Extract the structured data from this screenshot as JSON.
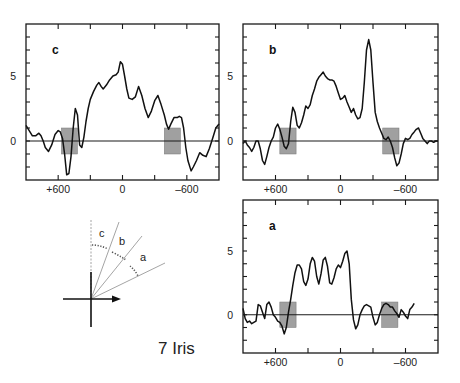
{
  "figure": {
    "caption": "7 Iris",
    "diagram": {
      "labels": [
        "c",
        "b",
        "a"
      ],
      "origin": [
        91,
        299
      ]
    }
  },
  "chart_data": [
    {
      "type": "line",
      "panel": "c",
      "title": "c",
      "xlabel": "",
      "ylabel": "",
      "xlim": [
        900,
        -900
      ],
      "ylim": [
        -3,
        9
      ],
      "xticks": [
        600,
        300,
        0,
        -300,
        -600
      ],
      "xtick_labels": [
        "+600",
        "",
        "0",
        "",
        "-600"
      ],
      "yticks": [
        -2,
        -1,
        0,
        1,
        2,
        3,
        4,
        5,
        6,
        7,
        8
      ],
      "ytick_labels": {
        "0": "0",
        "5": "5"
      },
      "shaded_regions": [
        {
          "x": [
            570,
            420
          ],
          "y": [
            -1,
            1
          ]
        },
        {
          "x": [
            -390,
            -540
          ],
          "y": [
            -1,
            1
          ]
        }
      ],
      "series": [
        {
          "name": "profile c",
          "x": [
            900,
            870,
            840,
            810,
            780,
            760,
            740,
            720,
            690,
            660,
            630,
            600,
            580,
            560,
            540,
            520,
            500,
            480,
            460,
            440,
            420,
            400,
            380,
            360,
            340,
            320,
            300,
            270,
            240,
            220,
            200,
            180,
            150,
            120,
            90,
            60,
            40,
            20,
            0,
            -20,
            -40,
            -60,
            -90,
            -120,
            -150,
            -180,
            -210,
            -240,
            -270,
            -300,
            -330,
            -360,
            -390,
            -410,
            -430,
            -450,
            -480,
            -510,
            -530,
            -550,
            -570,
            -590,
            -610,
            -640,
            -660,
            -690,
            -720,
            -750,
            -780,
            -810,
            -840,
            -870,
            -900
          ],
          "y": [
            1.2,
            0.8,
            0.4,
            0.4,
            0.6,
            0.4,
            0.0,
            -0.5,
            -0.8,
            -0.3,
            0.5,
            0.8,
            0.7,
            0.2,
            -1.0,
            -2.6,
            -2.5,
            -1.2,
            1.0,
            2.5,
            2.0,
            -0.3,
            -0.5,
            0.3,
            1.5,
            2.5,
            3.2,
            3.8,
            4.3,
            4.5,
            4.2,
            4.0,
            4.3,
            4.7,
            5.0,
            5.1,
            5.3,
            6.1,
            5.9,
            5.0,
            4.0,
            3.3,
            3.2,
            3.4,
            4.2,
            3.5,
            2.5,
            1.8,
            2.3,
            3.1,
            3.5,
            2.8,
            2.0,
            1.3,
            0.9,
            1.3,
            1.8,
            1.8,
            1.9,
            1.8,
            1.0,
            -0.5,
            -1.5,
            -2.3,
            -2.0,
            -1.5,
            -0.9,
            -1.1,
            -1.2,
            -0.6,
            0.2,
            1.0,
            1.3
          ]
        }
      ]
    },
    {
      "type": "line",
      "panel": "b",
      "title": "b",
      "xlabel": "",
      "ylabel": "",
      "xlim": [
        900,
        -900
      ],
      "ylim": [
        -3,
        9
      ],
      "xticks": [
        600,
        300,
        0,
        -300,
        -600
      ],
      "xtick_labels": [
        "+600",
        "",
        "0",
        "",
        "-600"
      ],
      "yticks": [
        -2,
        -1,
        0,
        1,
        2,
        3,
        4,
        5,
        6,
        7,
        8
      ],
      "ytick_labels": {
        "0": "0",
        "5": "5"
      },
      "shaded_regions": [
        {
          "x": [
            560,
            410
          ],
          "y": [
            -1,
            1
          ]
        },
        {
          "x": [
            -390,
            -540
          ],
          "y": [
            -1,
            1
          ]
        }
      ],
      "series": [
        {
          "name": "profile b",
          "x": [
            900,
            880,
            860,
            840,
            820,
            800,
            780,
            760,
            740,
            720,
            700,
            680,
            660,
            640,
            620,
            600,
            580,
            560,
            540,
            520,
            500,
            480,
            460,
            440,
            420,
            400,
            380,
            360,
            340,
            320,
            300,
            280,
            260,
            240,
            220,
            200,
            180,
            160,
            140,
            120,
            100,
            80,
            60,
            40,
            20,
            0,
            -20,
            -40,
            -60,
            -80,
            -100,
            -120,
            -140,
            -160,
            -180,
            -200,
            -220,
            -240,
            -260,
            -280,
            -300,
            -320,
            -340,
            -360,
            -380,
            -400,
            -420,
            -440,
            -460,
            -480,
            -500,
            -520,
            -540,
            -560,
            -580,
            -600,
            -620,
            -640,
            -660,
            -680,
            -700,
            -720,
            -740,
            -760,
            -780,
            -800,
            -820,
            -840,
            -860,
            -880,
            -900
          ],
          "y": [
            -0.2,
            0.0,
            -0.3,
            -0.5,
            -0.8,
            -0.5,
            0.0,
            0.0,
            -0.6,
            -1.5,
            -1.8,
            -1.2,
            -0.5,
            0.0,
            0.3,
            1.0,
            1.3,
            0.9,
            0.3,
            -0.4,
            -0.6,
            -0.2,
            1.5,
            2.6,
            2.2,
            1.2,
            1.0,
            1.4,
            2.0,
            2.7,
            2.5,
            2.8,
            3.5,
            4.0,
            4.6,
            4.9,
            5.1,
            5.3,
            5.0,
            4.8,
            4.7,
            4.7,
            4.6,
            4.2,
            3.7,
            3.2,
            3.3,
            3.5,
            3.0,
            2.6,
            2.2,
            2.5,
            2.0,
            1.7,
            1.8,
            2.5,
            4.5,
            7.0,
            7.8,
            7.0,
            4.5,
            2.2,
            1.5,
            1.0,
            0.6,
            0.2,
            0.1,
            0.3,
            0.0,
            -0.5,
            -1.3,
            -1.9,
            -1.7,
            -1.0,
            -0.2,
            0.2,
            0.1,
            0.2,
            0.5,
            0.7,
            0.9,
            1.0,
            0.6,
            0.2,
            0.0,
            -0.2,
            0.0,
            0.0,
            -0.1,
            0.0,
            0.0
          ]
        }
      ]
    },
    {
      "type": "line",
      "panel": "a",
      "title": "a",
      "xlabel": "",
      "ylabel": "",
      "xlim": [
        900,
        -900
      ],
      "ylim": [
        -3,
        9
      ],
      "xticks": [
        600,
        300,
        0,
        -300,
        -600
      ],
      "xtick_labels": [
        "+600",
        "",
        "0",
        "",
        "-600"
      ],
      "yticks": [
        -2,
        -1,
        0,
        1,
        2,
        3,
        4,
        5,
        6,
        7,
        8
      ],
      "ytick_labels": {
        "0": "0",
        "5": "5"
      },
      "shaded_regions": [
        {
          "x": [
            560,
            410
          ],
          "y": [
            -1,
            1
          ]
        },
        {
          "x": [
            -380,
            -530
          ],
          "y": [
            -1,
            1
          ]
        }
      ],
      "series": [
        {
          "name": "profile a",
          "x": [
            900,
            880,
            860,
            840,
            820,
            800,
            780,
            760,
            740,
            720,
            700,
            680,
            660,
            640,
            620,
            600,
            580,
            560,
            540,
            520,
            500,
            480,
            460,
            440,
            420,
            400,
            380,
            360,
            340,
            320,
            300,
            280,
            260,
            240,
            220,
            200,
            180,
            160,
            140,
            120,
            100,
            80,
            60,
            40,
            20,
            0,
            -20,
            -40,
            -60,
            -80,
            -100,
            -120,
            -140,
            -160,
            -180,
            -200,
            -220,
            -240,
            -260,
            -280,
            -300,
            -320,
            -340,
            -360,
            -380,
            -400,
            -420,
            -440,
            -460,
            -480,
            -500,
            -520,
            -540,
            -560,
            -580,
            -600,
            -620,
            -640,
            -660,
            -680,
            -700,
            -720,
            -740,
            -760,
            -780,
            -800,
            -820,
            -840,
            -860,
            -880,
            -900
          ],
          "y": [
            0.5,
            -0.3,
            -0.6,
            -0.5,
            -0.7,
            -0.6,
            -0.5,
            0.8,
            0.7,
            0.2,
            -0.3,
            0.8,
            1.0,
            0.6,
            0.0,
            -0.2,
            -0.5,
            -0.6,
            -0.9,
            -1.5,
            -1.0,
            0.2,
            1.2,
            2.3,
            3.3,
            3.9,
            3.9,
            3.6,
            2.6,
            2.3,
            2.8,
            4.0,
            4.5,
            4.2,
            3.0,
            2.4,
            3.2,
            4.3,
            4.5,
            3.8,
            2.5,
            2.4,
            2.9,
            3.6,
            3.9,
            3.7,
            4.2,
            4.8,
            5.0,
            4.0,
            1.2,
            -0.4,
            -1.1,
            -0.8,
            0.0,
            0.4,
            0.7,
            0.8,
            0.7,
            0.6,
            -0.2,
            -0.8,
            -0.6,
            0.0,
            0.5,
            0.8,
            0.9,
            0.8,
            0.6,
            0.6,
            0.3,
            0.1,
            -0.2,
            0.4,
            0.2,
            -0.1,
            -0.3,
            0.4,
            0.6,
            0.9
          ]
        }
      ]
    }
  ],
  "layout": {
    "panels": {
      "c": {
        "left": 26,
        "top": 24,
        "right": 219,
        "bottom": 180
      },
      "b": {
        "left": 243,
        "top": 24,
        "right": 438,
        "bottom": 180
      },
      "a": {
        "left": 243,
        "top": 200,
        "right": 438,
        "bottom": 353
      }
    }
  }
}
